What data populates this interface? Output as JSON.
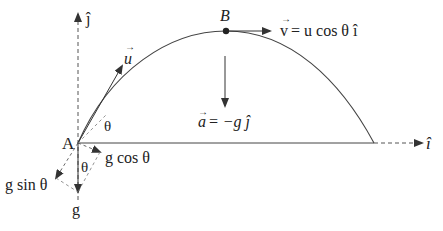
{
  "diagram": {
    "colors": {
      "stroke": "#3a3a3a",
      "text": "#222222",
      "background": "#ffffff"
    },
    "points": {
      "launch": {
        "label": "A"
      },
      "peak": {
        "label": "B"
      }
    },
    "axes": {
      "x_unit": "î",
      "y_unit": "ĵ"
    },
    "labels": {
      "initial_velocity": "u",
      "launch_angle": "θ",
      "peak_velocity": "v = u cos θ î",
      "peak_velocity_lhs": "v",
      "peak_velocity_rhs": "= u cos θ î",
      "acceleration": "a = −g ĵ",
      "acceleration_lhs": "a",
      "acceleration_rhs": "= −g ĵ",
      "gravity": "g",
      "gravity_angle": "θ",
      "g_cos": "g cos θ",
      "g_sin": "g sin θ"
    }
  }
}
